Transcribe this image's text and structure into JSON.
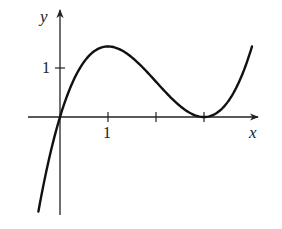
{
  "chart_data": {
    "type": "line",
    "title": "",
    "xlabel": "x",
    "ylabel": "y",
    "function_shape": "cubic with local max near x≈1.3 and double root (tangent to x-axis) at x=3; passes through origin",
    "approx_formula": "y = 0.36·x·(x−3)^2",
    "x_ticks": [
      1,
      2,
      3
    ],
    "x_tick_labels": [
      "1",
      "",
      ""
    ],
    "y_ticks": [
      1
    ],
    "y_tick_labels": [
      "1"
    ],
    "xlim": [
      -0.65,
      4.1
    ],
    "ylim": [
      -2.0,
      2.2
    ],
    "grid": false,
    "legend": null,
    "series": [
      {
        "name": "curve",
        "x": [
          -0.45,
          -0.3,
          -0.15,
          0,
          0.25,
          0.5,
          0.75,
          1.0,
          1.3,
          1.6,
          2.0,
          2.4,
          2.7,
          3.0,
          3.3,
          3.6,
          3.9,
          4.0
        ],
        "y": [
          -1.93,
          -1.18,
          -0.54,
          0,
          0.68,
          1.13,
          1.37,
          1.44,
          1.35,
          1.13,
          0.72,
          0.31,
          0.1,
          0,
          0.12,
          0.47,
          1.05,
          1.44
        ]
      }
    ],
    "key_points": {
      "origin": [
        0,
        0
      ],
      "local_max": [
        1.0,
        1.44
      ],
      "touch_point": [
        3,
        0
      ]
    }
  },
  "labels": {
    "x_axis": "x",
    "y_axis": "y",
    "x_tick_1": "1",
    "y_tick_1": "1"
  },
  "style": {
    "line_color": "#111111",
    "axis_color": "#222222",
    "background": "#ffffff"
  }
}
